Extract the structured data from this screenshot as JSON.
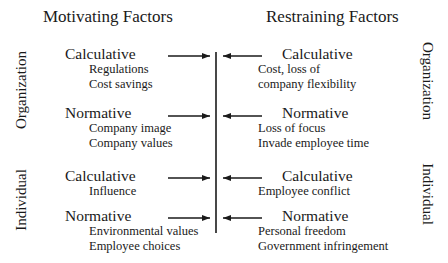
{
  "headers": {
    "motivating": "Motivating Factors",
    "restraining": "Restraining Factors"
  },
  "side_labels": {
    "left_top": "Organization",
    "left_bottom": "Individual",
    "right_top": "Organization",
    "right_bottom": "Individual"
  },
  "motivating": [
    {
      "category": "Calculative",
      "items": [
        "Regulations",
        "Cost savings"
      ]
    },
    {
      "category": "Normative",
      "items": [
        "Company image",
        "Company values"
      ]
    },
    {
      "category": "Calculative",
      "items": [
        "Influence"
      ]
    },
    {
      "category": "Normative",
      "items": [
        "Environmental values",
        "Employee choices"
      ]
    }
  ],
  "restraining": [
    {
      "category": "Calculative",
      "items": [
        "Cost, loss of",
        "company flexibility"
      ]
    },
    {
      "category": "Normative",
      "items": [
        "Loss of focus",
        "Invade employee time"
      ]
    },
    {
      "category": "Calculative",
      "items": [
        "Employee conflict"
      ]
    },
    {
      "category": "Normative",
      "items": [
        "Personal freedom",
        "Government infringement"
      ]
    }
  ],
  "colors": {
    "ink": "#1a1a1a",
    "background": "#ffffff"
  }
}
